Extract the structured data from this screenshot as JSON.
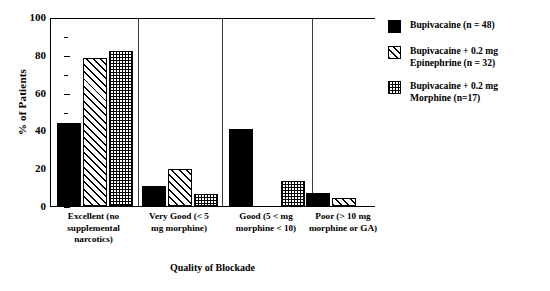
{
  "chart_data": {
    "type": "bar",
    "title": "",
    "xlabel": "Quality of Blockade",
    "ylabel": "% of Patients",
    "ylim": [
      0,
      100
    ],
    "ytick_labels": [
      "0",
      "20",
      "40",
      "60",
      "80",
      "100"
    ],
    "ytick_values": [
      0,
      20,
      40,
      60,
      80,
      100
    ],
    "yminor_values": [
      10,
      30,
      50,
      70,
      90
    ],
    "grid": false,
    "legend_position": "right",
    "categories": [
      "Excellent (no supplemental narcotics)",
      "Very Good (< 5 mg morphine)",
      "Good (5 < mg morphine < 10)",
      "Poor  (> 10 mg morphine or GA)"
    ],
    "category_lines": [
      [
        "Excellent (no",
        "supplemental",
        "narcotics)"
      ],
      [
        "Very Good (< 5",
        "mg morphine)"
      ],
      [
        "Good (5 < mg",
        "morphine < 10)"
      ],
      [
        "Poor  (> 10 mg",
        "morphine or GA)"
      ]
    ],
    "series": [
      {
        "name": "Bupivacaine (n = 48)",
        "legend_lines": "Bupivacaine (n = 48)",
        "fill": "solid",
        "values": [
          44,
          10.5,
          41,
          7
        ]
      },
      {
        "name": "Bupivacaine + 0.2 mg Epinephrine (n = 32)",
        "legend_lines": "Bupivacaine + 0.2 mg\nEpinephrine (n = 32)",
        "fill": "hatch",
        "values": [
          78.5,
          19.5,
          0,
          4
        ]
      },
      {
        "name": "Bupivacaine + 0.2 mg Morphine  (n=17)",
        "legend_lines": "Bupivacaine + 0.2 mg\nMorphine    (n=17)",
        "fill": "check",
        "values": [
          82,
          6.5,
          13,
          0
        ]
      }
    ]
  },
  "colors": {
    "axis": "#000000",
    "separator": "#3a3a3a",
    "series_solid": "#000000",
    "background": "#ffffff"
  }
}
